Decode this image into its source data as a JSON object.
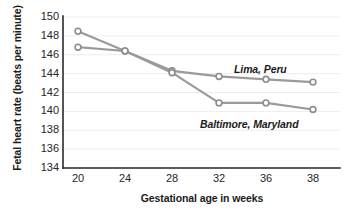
{
  "chart_data": {
    "type": "line",
    "title": "",
    "xlabel": "Gestational age in weeks",
    "ylabel": "Fetal heart rate (beats per minute)",
    "categories": [
      20,
      24,
      28,
      32,
      36,
      38
    ],
    "x_tick_labels": [
      "20",
      "24",
      "28",
      "32",
      "36",
      "38"
    ],
    "y_tick_labels": [
      "134",
      "136",
      "138",
      "140",
      "142",
      "144",
      "146",
      "148",
      "150"
    ],
    "y_ticks": [
      134,
      136,
      138,
      140,
      142,
      144,
      146,
      148,
      150
    ],
    "ylim": [
      134,
      150
    ],
    "xlim": [
      20,
      38
    ],
    "grid": "horizontal",
    "legend": "inline-annotations",
    "series": [
      {
        "name": "Lima, Peru",
        "values": [
          148.5,
          146.4,
          144.3,
          143.7,
          143.4,
          143.1
        ],
        "color": "#9a9a9a",
        "marker": "circle"
      },
      {
        "name": "Baltimore, Maryland",
        "values": [
          146.8,
          146.4,
          144.1,
          140.9,
          140.9,
          140.2
        ],
        "color": "#9a9a9a",
        "marker": "circle"
      }
    ],
    "annotations": [
      {
        "text": "Lima, Peru",
        "series": "Lima, Peru"
      },
      {
        "text": "Baltimore, Maryland",
        "series": "Baltimore, Maryland"
      }
    ]
  }
}
